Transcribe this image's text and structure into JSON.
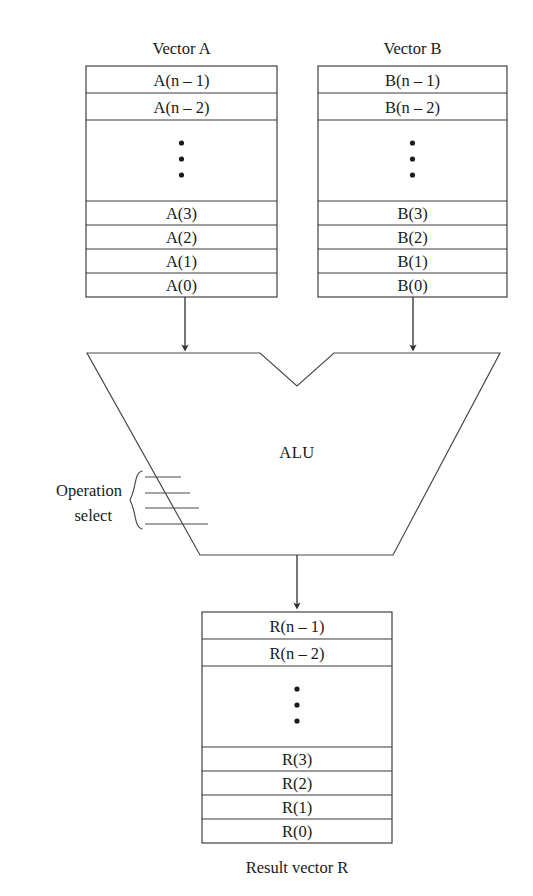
{
  "figure": {
    "kind": "block-diagram",
    "background_color": "#ffffff",
    "line_color": "#3a3a3a",
    "text_color": "#1a1a1a"
  },
  "vector_a": {
    "title": "Vector A",
    "cells": [
      "A(n – 1)",
      "A(n – 2)",
      "A(3)",
      "A(2)",
      "A(1)",
      "A(0)"
    ],
    "ellipsis": "⋮"
  },
  "vector_b": {
    "title": "Vector B",
    "cells": [
      "B(n – 1)",
      "B(n – 2)",
      "B(3)",
      "B(2)",
      "B(1)",
      "B(0)"
    ],
    "ellipsis": "⋮"
  },
  "result_vector": {
    "caption": "Result vector R",
    "cells": [
      "R(n – 1)",
      "R(n – 2)",
      "R(3)",
      "R(2)",
      "R(1)",
      "R(0)"
    ],
    "ellipsis": "⋮"
  },
  "alu": {
    "label": "ALU",
    "control": {
      "label_line1": "Operation",
      "label_line2": "select",
      "line_count": 4
    }
  },
  "connections": {
    "a_to_alu": "arrow-down",
    "b_to_alu": "arrow-down",
    "alu_to_result": "arrow-down"
  }
}
